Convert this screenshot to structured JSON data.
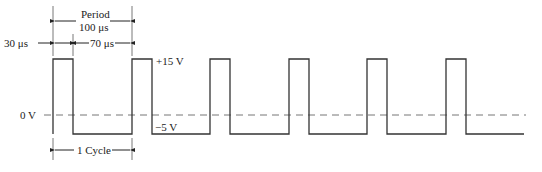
{
  "diagram": {
    "type": "pulse-waveform",
    "labels": {
      "period_title": "Period",
      "period_value": "100 μs",
      "pulse_width": "30 μs",
      "off_time": "70 μs",
      "high_level": "+15 V",
      "low_level": "−5 V",
      "zero_level": "0 V",
      "cycle": "1 Cycle"
    },
    "waveform": {
      "high_voltage": 15,
      "low_voltage": -5,
      "period_us": 100,
      "pulse_width_us": 30,
      "off_time_us": 70,
      "pulse_count": 6,
      "zero_reference": "dashed line"
    },
    "colors": {
      "line": "#333333",
      "dashed": "#777777",
      "text": "#222222"
    }
  }
}
